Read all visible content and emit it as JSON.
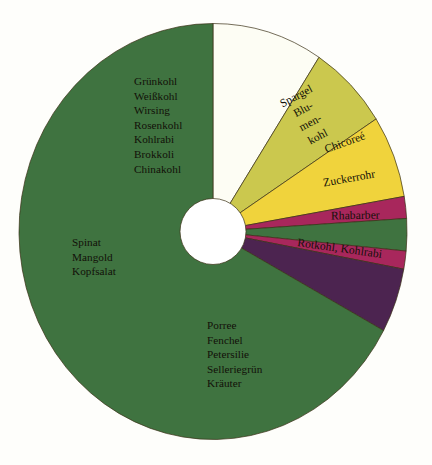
{
  "background_color": "#fefefb",
  "chart_data": {
    "type": "pie",
    "title": "",
    "subtitle": "",
    "xlabel": "",
    "ylabel": "",
    "legend_position": "none",
    "grid": false,
    "donut": true,
    "inner_radius_ratio": 0.17,
    "start_angle_deg": -90,
    "direction": "clockwise",
    "center_hole_color": "#ffffff",
    "outline_color": "#3a2f16",
    "slices": [
      {
        "name": "Spargel, Blumenkohl",
        "label": "Spargel\nBlu-\nmen-\nkohl",
        "value": 9.2,
        "color": "#fdfdf4"
      },
      {
        "name": "Chicoree",
        "label": "Chicoreé",
        "value": 6.7,
        "color": "#cbc84e"
      },
      {
        "name": "Zuckerrohr",
        "label": "Zuckerrohr",
        "value": 6.4,
        "color": "#f0d33c"
      },
      {
        "name": "Crimson band upper",
        "label": "",
        "value": 1.7,
        "color": "#a8275c"
      },
      {
        "name": "Rhabarber",
        "label": "Rhabarber",
        "value": 2.5,
        "color": "#3f7340"
      },
      {
        "name": "Crimson band lower",
        "label": "",
        "value": 1.4,
        "color": "#a8275c"
      },
      {
        "name": "Rotkohl, Kohlrabi",
        "label": "Rotkohl, Kohlrabi",
        "value": 5.0,
        "color": "#4c2450"
      },
      {
        "name": "Grüne Gemüse (Hauptanteil)",
        "label": "",
        "value": 67.1,
        "color": "#3f7340"
      }
    ],
    "annotations": [
      {
        "name": "kohl-group",
        "lines": [
          "Grünkohl",
          "Weißkohl",
          "Wirsing",
          "Rosenkohl",
          "Kohlrabi",
          "Brokkoli",
          "Chinakohl"
        ]
      },
      {
        "name": "blatt-group",
        "lines": [
          "Spinat",
          "Mangold",
          "Kopfsalat"
        ]
      },
      {
        "name": "kraeuter-group",
        "lines": [
          "Porree",
          "Fenchel",
          "Petersilie",
          "Selleriegrün",
          "Kräuter"
        ]
      }
    ]
  },
  "labels": {
    "kohl_group": "Grünkohl\nWeißkohl\nWirsing\nRosenkohl\nKohlrabi\nBrokkoli\nChinakohl",
    "blatt_group": "Spinat\nMangold\nKopfsalat",
    "kraeuter_group": "Porree\nFenchel\nPetersilie\nSelleriegrün\nKräuter",
    "spargel": "Spargel\nBlu-\nmen-\nkohl",
    "chicoree": "Chicoreé",
    "zuckerrohr": "Zuckerrohr",
    "rhabarber": "Rhabarber",
    "rotkohl": "Rotkohl, Kohlrabi"
  }
}
